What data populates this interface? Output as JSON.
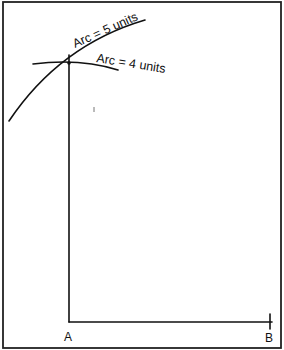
{
  "diagram": {
    "labels": {
      "arc5": "Arc  =  5 units",
      "arc4": "Arc  =  4 units",
      "point_a": "A",
      "point_b": "B"
    },
    "points": {
      "A": [
        69,
        322
      ],
      "B": [
        270,
        322
      ],
      "intersection": [
        69,
        63
      ]
    },
    "colors": {
      "ink": "#111111",
      "background": "#ffffff",
      "frame": "#222222"
    }
  }
}
